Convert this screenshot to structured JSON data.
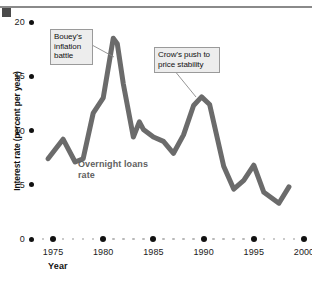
{
  "figure": {
    "rule_color": "#8a8a8a",
    "cap_color": "#4a4a4a"
  },
  "chart_data": {
    "type": "line",
    "title": "",
    "xlabel": "Year",
    "ylabel": "Interest rate (percent per year)",
    "xlim": [
      1974,
      2000
    ],
    "ylim": [
      0,
      20
    ],
    "yticks": [
      0,
      5,
      10,
      15,
      20
    ],
    "ytick_labels": [
      "0",
      "5",
      "10",
      "15",
      "20"
    ],
    "xticks": [
      1975,
      1980,
      1985,
      1990,
      1995,
      2000
    ],
    "xtick_labels": [
      "1975",
      "1980",
      "1985",
      "1990",
      "1995",
      "2000"
    ],
    "grid": false,
    "legend": "none",
    "line_color": "#6b6b6b",
    "line_width": 5,
    "series": [
      {
        "name": "Overnight loans rate",
        "color": "#6b6b6b",
        "x": [
          1974.5,
          1976,
          1977.2,
          1978,
          1979,
          1980,
          1981,
          1981.4,
          1982,
          1983,
          1983.6,
          1984,
          1985,
          1986,
          1987,
          1988,
          1989,
          1989.8,
          1990.6,
          1992,
          1993,
          1994,
          1995,
          1996,
          1997.5,
          1998.5
        ],
        "y": [
          7.4,
          9.2,
          7.1,
          7.4,
          11.6,
          13.0,
          18.5,
          18.0,
          14.3,
          9.4,
          10.8,
          10.1,
          9.4,
          9.0,
          7.9,
          9.6,
          12.3,
          13.1,
          12.4,
          6.7,
          4.6,
          5.4,
          6.8,
          4.3,
          3.3,
          4.8
        ]
      }
    ],
    "annotations": [
      {
        "name": "bouey",
        "text": "Bouey's inflation battle",
        "points_to_x": 1981.0,
        "points_to_y": 16.4
      },
      {
        "name": "crow",
        "text": "Crow's push to price stability",
        "points_to_x": 1989.5,
        "points_to_y": 13.2
      }
    ],
    "series_inline_label": "Overnight loans rate"
  }
}
